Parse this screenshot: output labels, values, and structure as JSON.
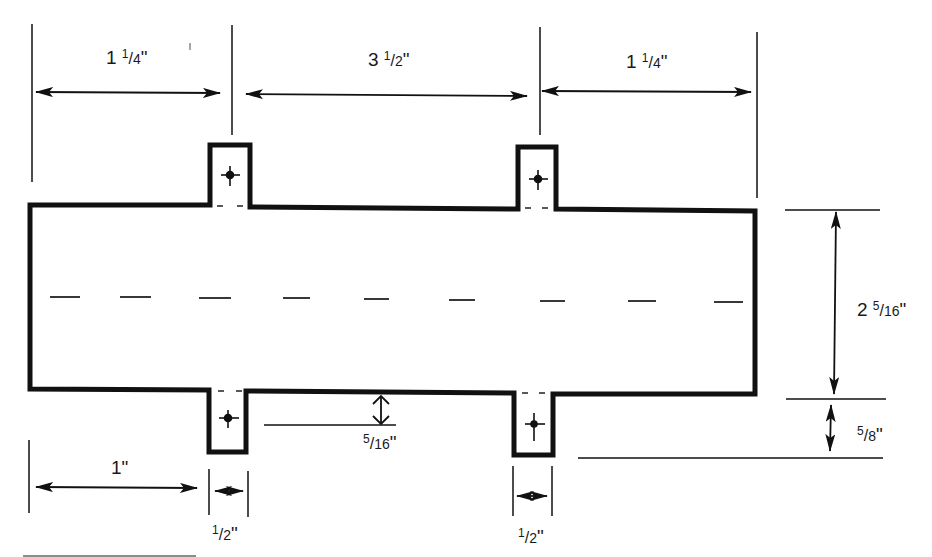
{
  "diagram": {
    "type": "dimensioned technical drawing",
    "colors": {
      "line": "#111111",
      "background": "#ffffff"
    },
    "dimensions": {
      "top_left": {
        "whole": "1",
        "num": "1",
        "den": "4",
        "unit": "\""
      },
      "top_middle": {
        "whole": "3",
        "num": "1",
        "den": "2",
        "unit": "\""
      },
      "top_right": {
        "whole": "1",
        "num": "1",
        "den": "4",
        "unit": "\""
      },
      "right_height": {
        "whole": "2",
        "num": "5",
        "den": "16",
        "unit": "\""
      },
      "right_tab_depth": {
        "whole": "",
        "num": "5",
        "den": "8",
        "unit": "\""
      },
      "tab_offset": {
        "whole": "",
        "num": "5",
        "den": "16",
        "unit": "\""
      },
      "bottom_left": {
        "whole": "1",
        "unit": "\""
      },
      "bottom_tab_width_left": {
        "whole": "",
        "num": "1",
        "den": "2",
        "unit": "\""
      },
      "bottom_tab_width_right": {
        "whole": "",
        "num": "1",
        "den": "2",
        "unit": "\""
      }
    }
  }
}
